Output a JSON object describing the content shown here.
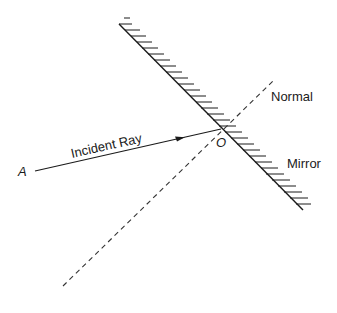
{
  "diagram": {
    "labels": {
      "incident_ray": "Incident Ray",
      "normal": "Normal",
      "mirror": "Mirror",
      "point_a": "A",
      "point_o": "O"
    },
    "geometry": {
      "mirror_start": [
        119,
        24
      ],
      "mirror_end": [
        303,
        210
      ],
      "point_o": [
        221,
        129
      ],
      "point_a": [
        33,
        172
      ],
      "normal_start": [
        63,
        286
      ],
      "normal_end": [
        274,
        80
      ]
    },
    "colors": {
      "line": "#1a1a1a",
      "dashed": "#333333",
      "background": "#ffffff"
    }
  }
}
